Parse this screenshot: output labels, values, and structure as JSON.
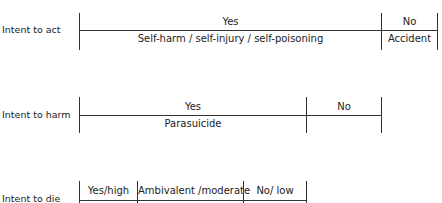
{
  "diagram": {
    "rows": [
      {
        "label": "Intent to act",
        "segments": [
          {
            "top": "Yes",
            "bottom": "Self-harm / self-injury / self-poisoning"
          },
          {
            "top": "No",
            "bottom": "Accident"
          }
        ]
      },
      {
        "label": "Intent to harm",
        "segments": [
          {
            "top": "Yes",
            "bottom": "Parasuicide"
          },
          {
            "top": "No",
            "bottom": ""
          }
        ]
      },
      {
        "label": "Intent to die",
        "segments": [
          {
            "top": "Yes/high",
            "bottom": ""
          },
          {
            "top": "Ambivalent /moderate",
            "bottom": ""
          },
          {
            "top": "No/ low",
            "bottom": ""
          }
        ]
      }
    ]
  }
}
